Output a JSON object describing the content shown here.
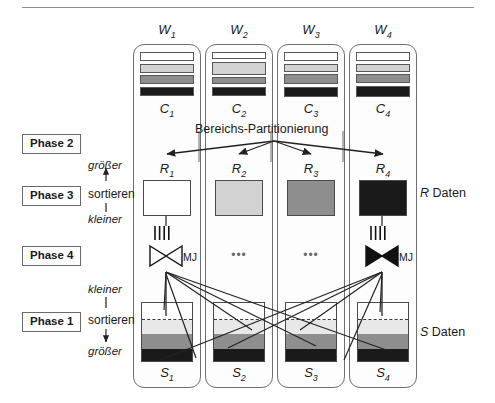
{
  "diagram": {
    "title_text": "Bereichs-Partitionierung",
    "top_rule": true,
    "right_labels": [
      {
        "id": "r-daten",
        "italic_prefix": "R",
        "text": " Daten",
        "top": 186
      },
      {
        "id": "s-daten",
        "italic_prefix": "S",
        "text": " Daten",
        "top": 325
      }
    ],
    "phases": [
      {
        "id": "phase-2",
        "label": "Phase 2",
        "top": 134,
        "left": 22
      },
      {
        "id": "phase-3",
        "label": "Phase 3",
        "top": 186,
        "left": 22
      },
      {
        "id": "phase-4",
        "label": "Phase 4",
        "top": 246,
        "left": 22
      },
      {
        "id": "phase-1",
        "label": "Phase 1",
        "top": 312,
        "left": 22
      }
    ],
    "sort_groups": [
      {
        "id": "sort-r",
        "verb": "sortieren",
        "verb_top": 187,
        "verb_left": 88,
        "top_word": "größer",
        "top_word_top": 159,
        "bottom_word": "kleiner",
        "bottom_word_top": 213,
        "arrow_dir": "up"
      },
      {
        "id": "sort-s",
        "verb": "sortieren",
        "verb_top": 313,
        "verb_left": 88,
        "top_word": "kleiner",
        "top_word_top": 283,
        "bottom_word": "größer",
        "bottom_word_top": 345,
        "arrow_dir": "down"
      }
    ],
    "mj_caption": "MJ",
    "ellipsis": "•••",
    "colors": {
      "white": "#ffffff",
      "light_gray": "#d2d2d2",
      "mid_gray": "#8e8e8e",
      "black": "#1a1a1a",
      "column_border": "#6f6f6f",
      "block_border": "#4a4a4a",
      "rule": "#8c8c8c"
    },
    "workers": [
      {
        "id": "w1",
        "label": "W",
        "index": "1",
        "left": 133,
        "c_label": "C",
        "c_index": "1",
        "c_stripes": [
          {
            "color": "#ffffff",
            "height": 9
          },
          {
            "color": "#d2d2d2",
            "height": 9
          },
          {
            "color": "#8e8e8e",
            "height": 9
          },
          {
            "color": "#1a1a1a",
            "height": 9
          }
        ],
        "r_label": "R",
        "r_index": "1",
        "r_color": "#ffffff",
        "mj_filled": false,
        "has_ellipsis": false,
        "s_label": "S",
        "s_index": "1",
        "s_bands": [
          {
            "color": "#ffffff",
            "height": 16
          },
          {
            "color": "#e8e8e8",
            "height": 14
          },
          {
            "color": "#8e8e8e",
            "height": 15
          },
          {
            "color": "#1a1a1a",
            "height": 15
          }
        ]
      },
      {
        "id": "w2",
        "label": "W",
        "index": "2",
        "left": 205,
        "c_label": "C",
        "c_index": "2",
        "c_stripes": [
          {
            "color": "#ffffff",
            "height": 7
          },
          {
            "color": "#d2d2d2",
            "height": 13
          },
          {
            "color": "#8e8e8e",
            "height": 7
          },
          {
            "color": "#1a1a1a",
            "height": 9
          }
        ],
        "r_label": "R",
        "r_index": "2",
        "r_color": "#d2d2d2",
        "mj_filled": null,
        "has_ellipsis": true,
        "s_label": "S",
        "s_index": "2",
        "s_bands": [
          {
            "color": "#ffffff",
            "height": 16
          },
          {
            "color": "#e8e8e8",
            "height": 14
          },
          {
            "color": "#8e8e8e",
            "height": 15
          },
          {
            "color": "#1a1a1a",
            "height": 15
          }
        ]
      },
      {
        "id": "w3",
        "label": "W",
        "index": "3",
        "left": 277,
        "c_label": "C",
        "c_index": "3",
        "c_stripes": [
          {
            "color": "#ffffff",
            "height": 9
          },
          {
            "color": "#d2d2d2",
            "height": 8
          },
          {
            "color": "#8e8e8e",
            "height": 10
          },
          {
            "color": "#1a1a1a",
            "height": 10
          }
        ],
        "r_label": "R",
        "r_index": "3",
        "r_color": "#8e8e8e",
        "mj_filled": null,
        "has_ellipsis": true,
        "s_label": "S",
        "s_index": "3",
        "s_bands": [
          {
            "color": "#ffffff",
            "height": 16
          },
          {
            "color": "#e8e8e8",
            "height": 14
          },
          {
            "color": "#8e8e8e",
            "height": 15
          },
          {
            "color": "#1a1a1a",
            "height": 15
          }
        ]
      },
      {
        "id": "w4",
        "label": "W",
        "index": "4",
        "left": 349,
        "c_label": "C",
        "c_index": "4",
        "c_stripes": [
          {
            "color": "#ffffff",
            "height": 9
          },
          {
            "color": "#d2d2d2",
            "height": 8
          },
          {
            "color": "#8e8e8e",
            "height": 9
          },
          {
            "color": "#1a1a1a",
            "height": 11
          }
        ],
        "r_label": "R",
        "r_index": "4",
        "r_color": "#1a1a1a",
        "mj_filled": true,
        "has_ellipsis": false,
        "s_label": "S",
        "s_index": "4",
        "s_bands": [
          {
            "color": "#ffffff",
            "height": 16
          },
          {
            "color": "#e8e8e8",
            "height": 14
          },
          {
            "color": "#8e8e8e",
            "height": 15
          },
          {
            "color": "#1a1a1a",
            "height": 15
          }
        ]
      }
    ]
  }
}
